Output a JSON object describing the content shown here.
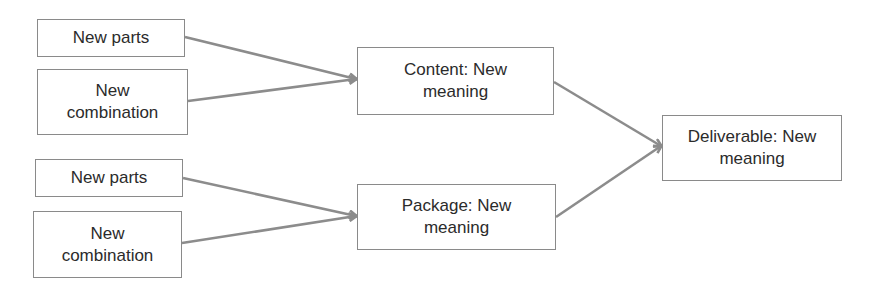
{
  "diagram": {
    "type": "flow",
    "colors": {
      "box_border": "#8a8a8a",
      "text": "#2b2b2b",
      "arrow": "#8c8c8c",
      "background": "#ffffff"
    },
    "nodes": [
      {
        "id": "n1",
        "label": "New parts",
        "x": 37,
        "y": 19,
        "w": 148,
        "h": 38
      },
      {
        "id": "n2",
        "label": "New combination",
        "x": 37,
        "y": 69,
        "w": 151,
        "h": 66
      },
      {
        "id": "n3",
        "label": "New parts",
        "x": 35,
        "y": 159,
        "w": 148,
        "h": 38
      },
      {
        "id": "n4",
        "label": "New combination",
        "x": 33,
        "y": 211,
        "w": 149,
        "h": 67
      },
      {
        "id": "content",
        "label": "Content: New meaning",
        "x": 357,
        "y": 47,
        "w": 197,
        "h": 68
      },
      {
        "id": "package",
        "label": "Package: New meaning",
        "x": 357,
        "y": 184,
        "w": 199,
        "h": 66
      },
      {
        "id": "deliverable",
        "label": "Deliverable: New meaning",
        "x": 662,
        "y": 115,
        "w": 180,
        "h": 66
      }
    ],
    "edges": [
      {
        "from": "n1",
        "to": "content",
        "x1": 185,
        "y1": 37,
        "x2": 356,
        "y2": 79
      },
      {
        "from": "n2",
        "to": "content",
        "x1": 188,
        "y1": 101,
        "x2": 356,
        "y2": 79
      },
      {
        "from": "n3",
        "to": "package",
        "x1": 183,
        "y1": 178,
        "x2": 356,
        "y2": 216
      },
      {
        "from": "n4",
        "to": "package",
        "x1": 182,
        "y1": 243,
        "x2": 356,
        "y2": 216
      },
      {
        "from": "content",
        "to": "deliverable",
        "x1": 554,
        "y1": 82,
        "x2": 661,
        "y2": 146
      },
      {
        "from": "package",
        "to": "deliverable",
        "x1": 556,
        "y1": 217,
        "x2": 661,
        "y2": 146
      }
    ]
  },
  "labels": {
    "top_parts": "New parts",
    "top_combination_line1": "New",
    "top_combination_line2": "combination",
    "bottom_parts": "New parts",
    "bottom_combination_line1": "New",
    "bottom_combination_line2": "combination",
    "content_line1": "Content: New",
    "content_line2": "meaning",
    "package_line1": "Package: New",
    "package_line2": "meaning",
    "deliverable_line1": "Deliverable: New",
    "deliverable_line2": "meaning"
  }
}
